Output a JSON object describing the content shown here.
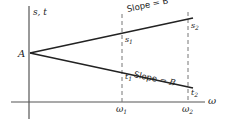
{
  "diagram": {
    "axis_y_label": "s, t",
    "axis_x_label": "ω",
    "origin_point_label": "A",
    "upper_line": {
      "slope_label": "Slope = B",
      "point1_label": "s",
      "point1_sub": "1",
      "point2_label": "s",
      "point2_sub": "2"
    },
    "lower_line": {
      "slope_label_prefix": "Slope = ",
      "slope_label_var": "B",
      "point1_label": "t",
      "point1_sub": "1",
      "point2_label": "t",
      "point2_sub": "2"
    },
    "x_ticks": [
      {
        "label": "ω",
        "sub": "1"
      },
      {
        "label": "ω",
        "sub": "2"
      }
    ],
    "colors": {
      "line": "#222222",
      "axis": "#555555",
      "dashed": "#777777"
    }
  }
}
